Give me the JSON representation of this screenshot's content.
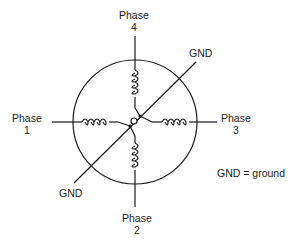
{
  "diagram": {
    "type": "stepper-motor-winding-schematic",
    "labels": {
      "phase4": {
        "line1": "Phase",
        "line2": "4"
      },
      "phase1": {
        "line1": "Phase",
        "line2": "1"
      },
      "phase3": {
        "line1": "Phase",
        "line2": "3"
      },
      "phase2": {
        "line1": "Phase",
        "line2": "2"
      },
      "gnd_top": "GND",
      "gnd_bottom": "GND",
      "legend": "GND = ground"
    },
    "nodes": [
      {
        "id": "phase1",
        "label": "Phase 1",
        "position": "left"
      },
      {
        "id": "phase2",
        "label": "Phase 2",
        "position": "bottom"
      },
      {
        "id": "phase3",
        "label": "Phase 3",
        "position": "right"
      },
      {
        "id": "phase4",
        "label": "Phase 4",
        "position": "top"
      },
      {
        "id": "gnd",
        "label": "GND",
        "position": "diagonal through center"
      }
    ],
    "edges": [
      {
        "from": "phase1",
        "to": "center",
        "element": "coil"
      },
      {
        "from": "phase2",
        "to": "center",
        "element": "coil"
      },
      {
        "from": "phase3",
        "to": "center",
        "element": "coil"
      },
      {
        "from": "phase4",
        "to": "center",
        "element": "coil"
      },
      {
        "from": "gnd",
        "to": "center",
        "element": "wire"
      }
    ],
    "colors": {
      "stroke": "#1a1a1a",
      "background": "#ffffff"
    }
  }
}
